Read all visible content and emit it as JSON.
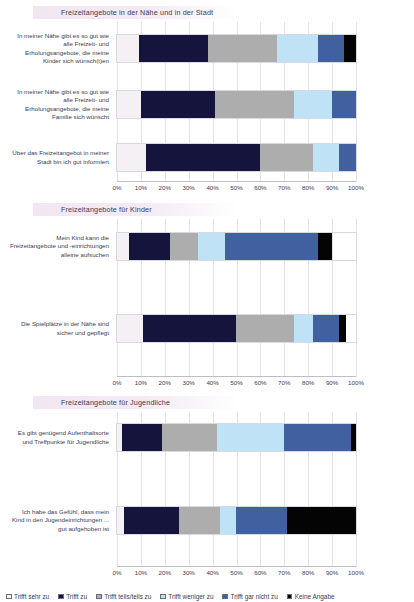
{
  "legend": {
    "items": [
      {
        "label": "Trifft sehr zu",
        "color": "#f4f0f4"
      },
      {
        "label": "Trifft zu",
        "color": "#14143c"
      },
      {
        "label": "Trifft teils/teils zu",
        "color": "#adadad"
      },
      {
        "label": "Trifft weniger zu",
        "color": "#bfe2f7"
      },
      {
        "label": "Trifft gar nicht zu",
        "color": "#41609f"
      },
      {
        "label": "Keine Angabe",
        "color": "#040404"
      }
    ]
  },
  "axis": {
    "ticks": [
      "0%",
      "10%",
      "20%",
      "30%",
      "40%",
      "50%",
      "60%",
      "70%",
      "80%",
      "90%",
      "100%"
    ]
  },
  "sections": [
    {
      "title": "Freizeitangebote in der Nähe und in der Stadt",
      "rows": [
        {
          "label": "In meiner Nähe gibt es so gut wie alle Freizeit- und Erholungsangebote, die meine Kinder sich wünsch(t)en",
          "values": [
            9,
            29,
            29,
            17,
            11,
            5
          ]
        },
        {
          "label": "In meiner Nähe gibt es so gut wie alle Freizeit- und Erholungsangebote, die meine Familie sich wünscht",
          "values": [
            10,
            31,
            33,
            16,
            10,
            0
          ]
        },
        {
          "label": "Über das Freizeitangebot in meiner Stadt bin ich gut informiert",
          "values": [
            12,
            48,
            22,
            11,
            7,
            0
          ]
        }
      ]
    },
    {
      "title": "Freizeitangebote für Kinder",
      "rows": [
        {
          "label": "Mein Kind kann die Freizeitangebote und -einrichtungen alleine aufsuchen",
          "values": [
            5,
            17,
            12,
            11,
            39,
            6
          ]
        },
        {
          "label": "Die Spielplätze in der Nähe sind sicher und gepflegt",
          "values": [
            11,
            39,
            24,
            8,
            11,
            3
          ]
        }
      ]
    },
    {
      "title": "Freizeitangebote für Jugendliche",
      "rows": [
        {
          "label": "Es gibt genügend Aufenthaltsorte und Treffpunkte für Jugendliche",
          "values": [
            2,
            17,
            23,
            28,
            28,
            2
          ]
        },
        {
          "label": "Ich habe das Gefühl, dass mein Kind in den Jugendeinrichtungen ... gut aufgehoben ist",
          "values": [
            3,
            23,
            17,
            7,
            21,
            29
          ]
        }
      ]
    }
  ],
  "chart_data": {
    "type": "bar",
    "orientation": "horizontal",
    "stacked": true,
    "normalized_percent": true,
    "xlabel": "",
    "ylabel": "",
    "xlim": [
      0,
      100
    ],
    "xticks": [
      0,
      10,
      20,
      30,
      40,
      50,
      60,
      70,
      80,
      90,
      100
    ],
    "grid": true,
    "legend_position": "bottom",
    "series": [
      {
        "name": "Trifft sehr zu",
        "color": "#f4f0f4",
        "values": [
          9,
          10,
          12,
          5,
          11,
          2,
          3
        ]
      },
      {
        "name": "Trifft zu",
        "color": "#14143c",
        "values": [
          29,
          31,
          48,
          17,
          39,
          17,
          23
        ]
      },
      {
        "name": "Trifft teils/teils zu",
        "color": "#adadad",
        "values": [
          29,
          33,
          22,
          12,
          24,
          23,
          17
        ]
      },
      {
        "name": "Trifft weniger zu",
        "color": "#bfe2f7",
        "values": [
          17,
          16,
          11,
          11,
          8,
          28,
          7
        ]
      },
      {
        "name": "Trifft gar nicht zu",
        "color": "#41609f",
        "values": [
          11,
          10,
          7,
          39,
          11,
          28,
          21
        ]
      },
      {
        "name": "Keine Angabe",
        "color": "#040404",
        "values": [
          5,
          0,
          0,
          6,
          3,
          2,
          29
        ]
      }
    ],
    "categories": [
      "In meiner Nähe gibt es so gut wie alle Freizeit- und Erholungsangebote, die meine Kinder sich wünsch(t)en",
      "In meiner Nähe gibt es so gut wie alle Freizeit- und Erholungsangebote, die meine Familie sich wünscht",
      "Über das Freizeitangebot in meiner Stadt bin ich gut informiert",
      "Mein Kind kann die Freizeitangebote und -einrichtungen alleine aufsuchen",
      "Die Spielplätze in der Nähe sind sicher und gepflegt",
      "Es gibt genügend Aufenthaltsorte und Treffpunkte für Jugendliche",
      "Ich habe das Gefühl, dass mein Kind in den Jugendeinrichtungen ... gut aufgehoben ist"
    ],
    "group_titles": [
      "Freizeitangebote in der Nähe und in der Stadt",
      "Freizeitangebote für Kinder",
      "Freizeitangebote für Jugendliche"
    ]
  }
}
